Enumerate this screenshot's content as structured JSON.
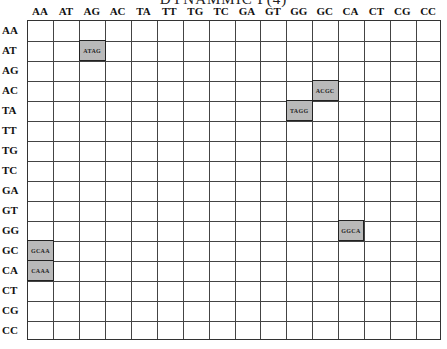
{
  "title": "DYNAMMIC P(4)",
  "chart_data": {
    "type": "table",
    "title": "DYNAMMIC P(4)",
    "columns": [
      "AA",
      "AT",
      "AG",
      "AC",
      "TA",
      "TT",
      "TG",
      "TC",
      "GA",
      "GT",
      "GG",
      "GC",
      "CA",
      "CT",
      "CG",
      "CC"
    ],
    "rows": [
      "AA",
      "AT",
      "AG",
      "AC",
      "TA",
      "TT",
      "TG",
      "TC",
      "GA",
      "GT",
      "GG",
      "GC",
      "CA",
      "CT",
      "CG",
      "CC"
    ],
    "filled_cells": [
      {
        "row": "AT",
        "col": "AG",
        "label": "ATAG"
      },
      {
        "row": "AC",
        "col": "GC",
        "label": "ACGC"
      },
      {
        "row": "TA",
        "col": "GG",
        "label": "TAGG"
      },
      {
        "row": "GG",
        "col": "CA",
        "label": "GGCA"
      },
      {
        "row": "GC",
        "col": "AA",
        "label": "GCAA"
      },
      {
        "row": "CA",
        "col": "AA",
        "label": "CAAA"
      }
    ],
    "fill_color": "#b9b9b9"
  },
  "cols": [
    "AA",
    "AT",
    "AG",
    "AC",
    "TA",
    "TT",
    "TG",
    "TC",
    "GA",
    "GT",
    "GG",
    "GC",
    "CA",
    "CT",
    "CG",
    "CC"
  ],
  "rows": [
    "AA",
    "AT",
    "AG",
    "AC",
    "TA",
    "TT",
    "TG",
    "TC",
    "GA",
    "GT",
    "GG",
    "GC",
    "CA",
    "CT",
    "CG",
    "CC"
  ],
  "cells": [
    {
      "r": 1,
      "c": 2,
      "label": "ATAG"
    },
    {
      "r": 3,
      "c": 11,
      "label": "ACGC"
    },
    {
      "r": 4,
      "c": 10,
      "label": "TAGG"
    },
    {
      "r": 10,
      "c": 12,
      "label": "GGCA"
    },
    {
      "r": 11,
      "c": 0,
      "label": "GCAA"
    },
    {
      "r": 12,
      "c": 0,
      "label": "CAAA"
    }
  ]
}
